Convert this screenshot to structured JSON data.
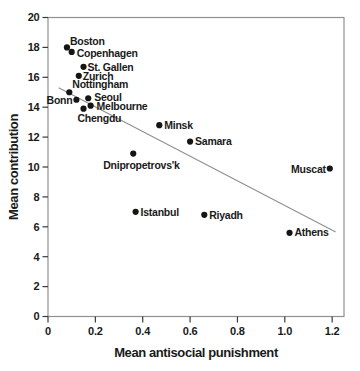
{
  "chart_data": {
    "type": "scatter",
    "title": "",
    "xlabel": "Mean antisocial punishment",
    "ylabel": "Mean contribution",
    "xlim": [
      0,
      1.25
    ],
    "ylim": [
      0,
      20
    ],
    "x_ticks": [
      0,
      0.2,
      0.4,
      0.6,
      0.8,
      1.0,
      1.2
    ],
    "x_tick_labels": [
      "0",
      "0.2",
      "0.4",
      "0.6",
      "0.8",
      "1.0",
      "1.2"
    ],
    "y_ticks": [
      0,
      2,
      4,
      6,
      8,
      10,
      12,
      14,
      16,
      18,
      20
    ],
    "y_tick_labels": [
      "0",
      "2",
      "4",
      "6",
      "8",
      "10",
      "12",
      "14",
      "16",
      "18",
      "20"
    ],
    "grid": false,
    "legend": "none",
    "point_color": "#151515",
    "trend_color": "#8f8f8f",
    "frame_color": "#909090",
    "tick_color": "#3a3a3a",
    "points": [
      {
        "label": "Boston",
        "x": 0.08,
        "y": 18.0,
        "side": "right",
        "dx": 3,
        "dy": -6
      },
      {
        "label": "Copenhagen",
        "x": 0.1,
        "y": 17.7,
        "side": "right",
        "dx": 5,
        "dy": 1
      },
      {
        "label": "St. Gallen",
        "x": 0.15,
        "y": 16.7,
        "side": "right",
        "dx": 4,
        "dy": 0
      },
      {
        "label": "Zurich",
        "x": 0.13,
        "y": 16.1,
        "side": "right",
        "dx": 4,
        "dy": 0
      },
      {
        "label": "Nottingham",
        "x": 0.09,
        "y": 15.0,
        "side": "right",
        "dx": 3,
        "dy": -8
      },
      {
        "label": "Bonn",
        "x": 0.12,
        "y": 14.5,
        "side": "left",
        "dx": 4,
        "dy": 1
      },
      {
        "label": "Seoul",
        "x": 0.17,
        "y": 14.6,
        "side": "right",
        "dx": 6,
        "dy": -1
      },
      {
        "label": "Melbourne",
        "x": 0.18,
        "y": 14.1,
        "side": "right",
        "dx": 6,
        "dy": 1
      },
      {
        "label": "Chengdu",
        "x": 0.15,
        "y": 13.9,
        "side": "right",
        "dx": -6,
        "dy": 10
      },
      {
        "label": "Minsk",
        "x": 0.47,
        "y": 12.8,
        "side": "right",
        "dx": 5,
        "dy": 0
      },
      {
        "label": "Samara",
        "x": 0.6,
        "y": 11.7,
        "side": "right",
        "dx": 5,
        "dy": 0
      },
      {
        "label": "Dnipropetrovs'k",
        "x": 0.36,
        "y": 10.9,
        "side": "right",
        "dx": -30,
        "dy": 12
      },
      {
        "label": "Istanbul",
        "x": 0.37,
        "y": 7.0,
        "side": "right",
        "dx": 5,
        "dy": 0
      },
      {
        "label": "Riyadh",
        "x": 0.66,
        "y": 6.8,
        "side": "right",
        "dx": 5,
        "dy": 0
      },
      {
        "label": "Muscat",
        "x": 1.19,
        "y": 9.9,
        "side": "left",
        "dx": 4,
        "dy": 1
      },
      {
        "label": "Athens",
        "x": 1.02,
        "y": 5.6,
        "side": "right",
        "dx": 5,
        "dy": 0
      }
    ],
    "trend_line": {
      "x1": 0.045,
      "y1": 15.3,
      "x2": 1.215,
      "y2": 5.65
    }
  }
}
